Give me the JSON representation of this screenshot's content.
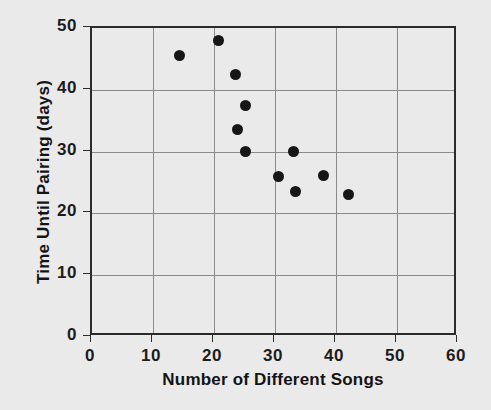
{
  "chart_data": {
    "type": "scatter",
    "title": "",
    "xlabel": "Number of Different Songs",
    "ylabel": "Time Until Pairing (days)",
    "xlim": [
      0,
      60
    ],
    "ylim": [
      0,
      50
    ],
    "xticks": [
      0,
      10,
      20,
      30,
      40,
      50,
      60
    ],
    "yticks": [
      0,
      10,
      20,
      30,
      40,
      50
    ],
    "xtick_labels": [
      "0",
      "10",
      "20",
      "30",
      "40",
      "50",
      "60"
    ],
    "ytick_labels": [
      "0",
      "10",
      "20",
      "30",
      "40",
      "50"
    ],
    "grid": true,
    "legend": null,
    "marker": {
      "shape": "circle",
      "color": "#161616",
      "size_px": 11
    },
    "points": [
      {
        "x": 14.4,
        "y": 45.5
      },
      {
        "x": 20.8,
        "y": 48.0
      },
      {
        "x": 23.6,
        "y": 42.4
      },
      {
        "x": 25.2,
        "y": 37.5
      },
      {
        "x": 23.9,
        "y": 33.5
      },
      {
        "x": 25.2,
        "y": 30.0
      },
      {
        "x": 30.5,
        "y": 26.0
      },
      {
        "x": 33.1,
        "y": 30.0
      },
      {
        "x": 33.4,
        "y": 23.6
      },
      {
        "x": 38.0,
        "y": 26.2
      },
      {
        "x": 42.1,
        "y": 23.0
      }
    ]
  },
  "colors": {
    "background": "#ebeaea",
    "frame": "#2b2b2b",
    "gridline": "#8a8a8a",
    "marker": "#161616",
    "text": "#141414"
  }
}
